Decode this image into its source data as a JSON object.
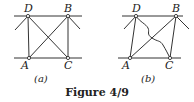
{
  "figure": {
    "caption": "Figure 4/9",
    "panels": [
      {
        "id": "a",
        "label": "(a)",
        "points": {
          "D": "D",
          "B": "B",
          "A": "A",
          "C": "C"
        },
        "description": "Rectangular frame ABCD pinned between two horizontal lines, with two crossing diagonal members AB and DC"
      },
      {
        "id": "b",
        "label": "(b)",
        "points": {
          "D": "D",
          "B": "B",
          "A": "A",
          "C": "C"
        },
        "description": "Parallelogram frame ABCD with straight diagonal AB and a curved (wavy) member from D to C"
      }
    ]
  }
}
